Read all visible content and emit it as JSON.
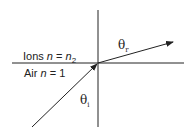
{
  "diagram": {
    "type": "refraction",
    "labels": {
      "upper_medium": {
        "name": "Ions",
        "n_var": "n",
        "eq": " = ",
        "n_val": "n",
        "n_sub": "2"
      },
      "lower_medium": {
        "name": "Air",
        "n_var": "n",
        "eq": " = ",
        "n_val": "1"
      },
      "refracted_angle": {
        "symbol": "θ",
        "sub": "r"
      },
      "incident_angle": {
        "symbol": "θ",
        "sub": "i"
      }
    },
    "colors": {
      "line": "#222222",
      "background": "#ffffff"
    }
  }
}
